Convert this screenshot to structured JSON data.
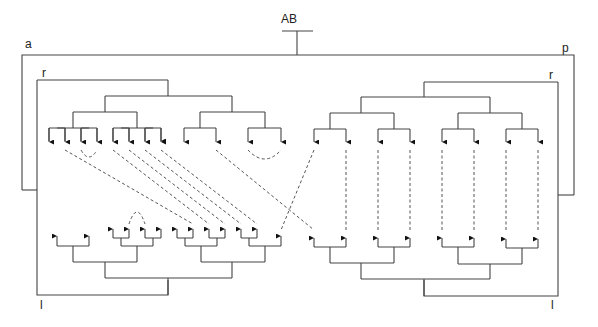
{
  "labels": {
    "root": "AB",
    "left_outer": "a",
    "right_outer": "p",
    "left_top_inner": "r",
    "right_top_inner": "r",
    "left_bottom_inner": "l",
    "right_bottom_inner": "l"
  },
  "colors": {
    "line": "#444444",
    "dashed": "#555555",
    "arrowhead": "#111111",
    "background": "#ffffff"
  },
  "trees": {
    "top_left": {
      "orientation": "down",
      "leaf_x": [
        49,
        65,
        81,
        97,
        113,
        129,
        145,
        161,
        184,
        216,
        248,
        281
      ]
    },
    "bottom_left": {
      "orientation": "up",
      "leaf_x": [
        57,
        89,
        113,
        129,
        145,
        161,
        177,
        193,
        209,
        225,
        241,
        257,
        281
      ]
    },
    "top_right": {
      "orientation": "down",
      "leaf_x": [
        314,
        346,
        378,
        410,
        442,
        474,
        506,
        538
      ]
    },
    "bottom_right": {
      "orientation": "up",
      "leaf_x": [
        314,
        346,
        378,
        410,
        442,
        474,
        506,
        538
      ]
    }
  },
  "dashed_links": [
    {
      "from": "top_left.1",
      "to": "bottom_left.6"
    },
    {
      "from": "top_left.2",
      "to": "top_left.3",
      "type": "arc"
    },
    {
      "from": "top_left.4",
      "to": "bottom_left.7"
    },
    {
      "from": "top_left.5",
      "to": "bottom_left.9"
    },
    {
      "from": "top_left.6",
      "to": "bottom_left.8"
    },
    {
      "from": "top_left.7",
      "to": "bottom_left.11"
    },
    {
      "from": "top_left.9",
      "to": "bottom_right.0"
    },
    {
      "from": "top_left.10",
      "to": "top_left.11",
      "type": "arc"
    },
    {
      "from": "top_right.0",
      "to": "bottom_left.12"
    },
    {
      "from": "bottom_left.3",
      "to": "bottom_left.4",
      "type": "arc"
    },
    {
      "from": "top_right.1",
      "to": "bottom_right.1"
    },
    {
      "from": "top_right.2",
      "to": "bottom_right.2"
    },
    {
      "from": "top_right.3",
      "to": "bottom_right.3"
    },
    {
      "from": "top_right.4",
      "to": "bottom_right.4"
    },
    {
      "from": "top_right.5",
      "to": "bottom_right.5"
    },
    {
      "from": "top_right.6",
      "to": "bottom_right.6"
    },
    {
      "from": "top_right.7",
      "to": "bottom_right.7"
    }
  ]
}
